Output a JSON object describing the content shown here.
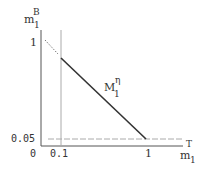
{
  "diagram": {
    "y_axis": {
      "symbol": "m",
      "subscript": "1",
      "superscript": "B"
    },
    "x_axis": {
      "symbol": "m",
      "subscript": "1",
      "superscript": "T"
    },
    "curve_label": {
      "symbol": "M",
      "subscript": "1",
      "superscript": "η"
    },
    "ticks": {
      "y_one": "1",
      "y_005": "0.05",
      "origin": "0",
      "x_01": "0.1",
      "x_one": "1"
    },
    "colors": {
      "axis": "#555555",
      "guide": "#aaaaaa",
      "line": "#333333"
    }
  }
}
